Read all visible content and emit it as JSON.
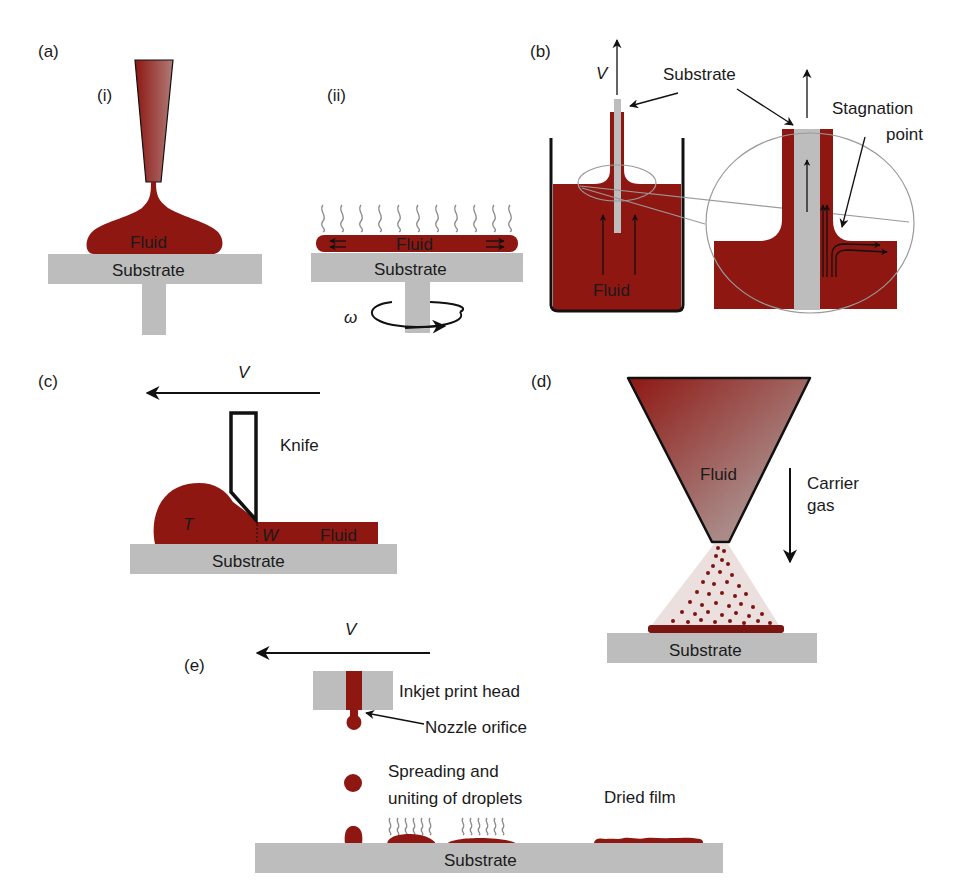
{
  "figure": {
    "colors": {
      "fluid": "#8e1712",
      "substrate": "#bdbdbd",
      "outline": "#111111",
      "vapor": "#8a8a8a",
      "magnifier": "#9a9a9a"
    }
  },
  "panel_a": {
    "label": "(a)",
    "sub_i": {
      "label": "(i)",
      "fluid_label": "Fluid",
      "substrate_label": "Substrate",
      "icon": "nozzle-drop-casting"
    },
    "sub_ii": {
      "label": "(ii)",
      "fluid_label": "Fluid",
      "substrate_label": "Substrate",
      "rotation_symbol": "ω",
      "icon": "spin-rotation-arrow"
    }
  },
  "panel_b": {
    "label": "(b)",
    "velocity_label": "V",
    "substrate_label": "Substrate",
    "fluid_label": "Fluid",
    "stagnation_label_line1": "Stagnation",
    "stagnation_label_line2": "point"
  },
  "panel_c": {
    "label": "(c)",
    "velocity_label": "V",
    "knife_label": "Knife",
    "reservoir_label": "T",
    "gap_label": "W",
    "fluid_label": "Fluid",
    "substrate_label": "Substrate"
  },
  "panel_d": {
    "label": "(d)",
    "fluid_label": "Fluid",
    "carrier_line1": "Carrier",
    "carrier_line2": "gas",
    "substrate_label": "Substrate"
  },
  "panel_e": {
    "label": "(e)",
    "velocity_label": "V",
    "printhead_label": "Inkjet print head",
    "nozzle_label": "Nozzle orifice",
    "spreading_line1": "Spreading and",
    "spreading_line2": "uniting of droplets",
    "dried_label": "Dried film",
    "substrate_label": "Substrate"
  }
}
